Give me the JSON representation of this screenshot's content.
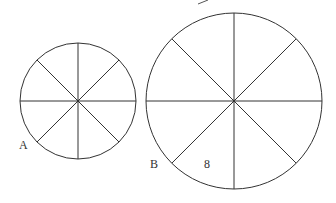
{
  "figure": {
    "circles": [
      {
        "id": "A",
        "label": "A",
        "cx": 78,
        "cy": 101,
        "r": 58,
        "sectors": 8
      },
      {
        "id": "B",
        "label": "B",
        "cx": 234,
        "cy": 101,
        "r": 88,
        "sectors": 8
      }
    ],
    "sector_label": "8",
    "stroke_color": "#333333"
  }
}
